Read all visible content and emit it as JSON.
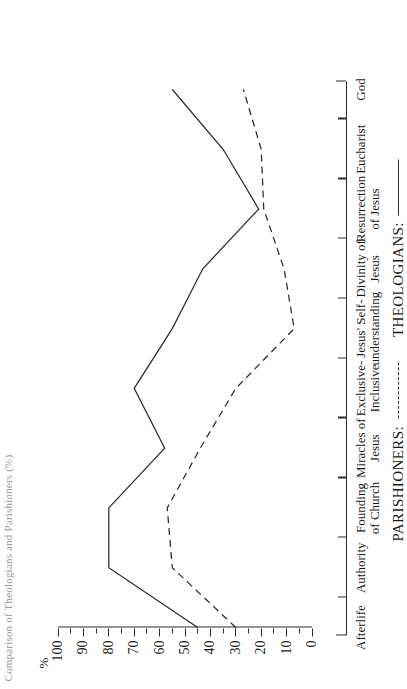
{
  "figure": {
    "title_fragment": "Comparison of Theologians and Parishioners (%)"
  },
  "chart_data": {
    "type": "line",
    "title": "",
    "xlabel": "",
    "ylabel": "%",
    "ylim": [
      0,
      100
    ],
    "y_major_step": 10,
    "y_minor_step": 5,
    "grid": false,
    "legend_position": "bottom",
    "categories": [
      "Afterlife",
      "Authority",
      "Founding\nof Church",
      "Miracles of\nJesus",
      "Exclusive-\nInclusive",
      "Jesus' Self-\nunderstanding",
      "Divinity of\nJesus",
      "Resurrection\nof Jesus",
      "Eucharist",
      "God"
    ],
    "y_tick_labels": [
      "0",
      "10",
      "20",
      "30",
      "40",
      "50",
      "60",
      "70",
      "80",
      "90",
      "100"
    ],
    "series": [
      {
        "name": "THEOLOGIANS:",
        "style": "solid",
        "color": "#2b2b2b",
        "values": [
          45,
          80,
          80,
          58,
          70,
          55,
          43,
          21,
          35,
          55
        ]
      },
      {
        "name": "PARISHIONERS:",
        "style": "dashed",
        "color": "#2b2b2b",
        "values": [
          30,
          55,
          57,
          44,
          30,
          7,
          11,
          19,
          20,
          27
        ]
      }
    ]
  },
  "legend": {
    "entries": [
      {
        "label": "PARISHIONERS:",
        "style": "dashed"
      },
      {
        "label": "THEOLOGIANS:",
        "style": "solid"
      }
    ]
  }
}
